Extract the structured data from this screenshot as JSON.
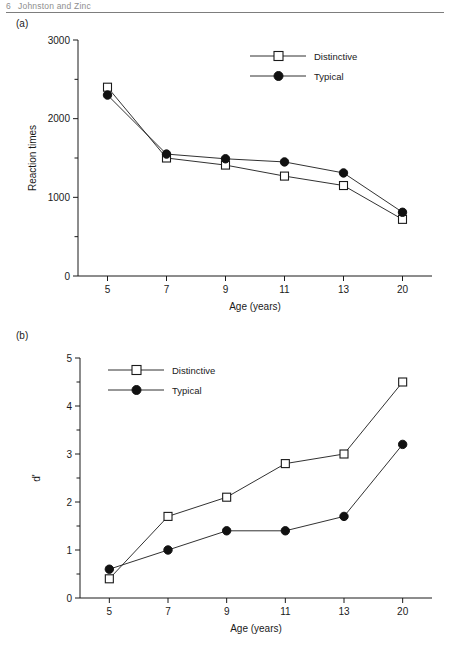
{
  "page": {
    "running_head": "Johnston and Zinc",
    "head_number": "6",
    "panel_a_label": "(a)",
    "panel_b_label": "(b)"
  },
  "legend": {
    "distinctive": "Distinctive",
    "typical": "Typical"
  },
  "chart_data": [
    {
      "type": "line",
      "panel": "(a)",
      "title": "",
      "xlabel": "Age (years)",
      "ylabel": "Reaction times",
      "categories": [
        "5",
        "7",
        "9",
        "11",
        "13",
        "20"
      ],
      "x": [
        5,
        7,
        9,
        11,
        13,
        20
      ],
      "ylim": [
        0,
        3000
      ],
      "ytick_major": [
        0,
        1000,
        2000,
        3000
      ],
      "ytick_minor": [
        500,
        1500,
        2500
      ],
      "ytick_labels": [
        "0",
        "1000",
        "2000",
        "3000"
      ],
      "grid": false,
      "legend_position": "top-right",
      "series": [
        {
          "name": "Distinctive",
          "marker": "open-square",
          "values": [
            2400,
            1500,
            1410,
            1270,
            1150,
            720
          ]
        },
        {
          "name": "Typical",
          "marker": "filled-circle",
          "values": [
            2300,
            1550,
            1490,
            1450,
            1310,
            810
          ]
        }
      ]
    },
    {
      "type": "line",
      "panel": "(b)",
      "title": "",
      "xlabel": "Age (years)",
      "ylabel": "d'",
      "categories": [
        "5",
        "7",
        "9",
        "11",
        "13",
        "20"
      ],
      "x": [
        5,
        7,
        9,
        11,
        13,
        20
      ],
      "ylim": [
        0,
        5
      ],
      "ytick_major": [
        0,
        1,
        2,
        3,
        4,
        5
      ],
      "ytick_minor": [
        0.5,
        1.5,
        2.5,
        3.5,
        4.5
      ],
      "ytick_labels": [
        "0",
        "1",
        "2",
        "3",
        "4",
        "5"
      ],
      "grid": false,
      "legend_position": "top-left",
      "series": [
        {
          "name": "Distinctive",
          "marker": "open-square",
          "values": [
            0.4,
            1.7,
            2.1,
            2.8,
            3.0,
            4.5
          ]
        },
        {
          "name": "Typical",
          "marker": "filled-circle",
          "values": [
            0.6,
            1.0,
            1.4,
            1.4,
            1.7,
            3.2
          ]
        }
      ]
    }
  ]
}
